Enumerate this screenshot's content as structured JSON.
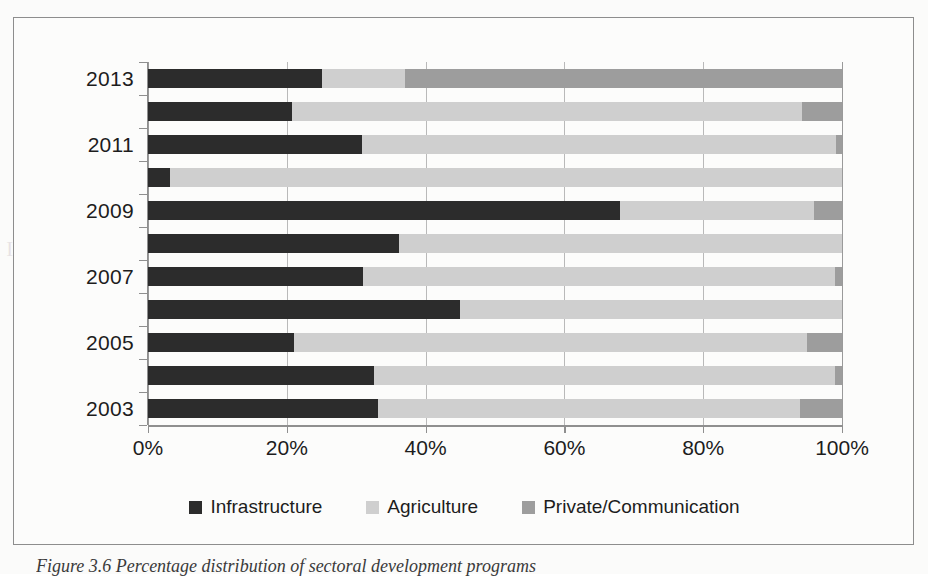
{
  "figure": {
    "caption": "Figure 3.6 Percentage distribution of sectoral development programs"
  },
  "chart_data": {
    "type": "bar",
    "orientation": "horizontal",
    "stacked": true,
    "normalized": true,
    "title": "",
    "xlabel": "",
    "ylabel": "",
    "xlim": [
      0,
      100
    ],
    "xticks": [
      "0%",
      "20%",
      "40%",
      "60%",
      "80%",
      "100%"
    ],
    "xtick_values": [
      0,
      20,
      40,
      60,
      80,
      100
    ],
    "grid": true,
    "grid_axis": "x",
    "legend_position": "bottom",
    "categories": [
      "2013",
      "2012",
      "2011",
      "2010",
      "2009",
      "2008",
      "2007",
      "2006",
      "2005",
      "2004",
      "2003"
    ],
    "visible_category_labels": [
      "2013",
      "2011",
      "2009",
      "2007",
      "2005",
      "2003"
    ],
    "series": [
      {
        "name": "Infrastructure",
        "color": "#2c2c2c",
        "values": [
          25.0,
          20.8,
          30.8,
          3.2,
          68.0,
          36.2,
          31.0,
          45.0,
          21.0,
          32.5,
          33.2
        ]
      },
      {
        "name": "Agriculture",
        "color": "#cfcfcf",
        "values": [
          12.0,
          73.4,
          68.4,
          96.8,
          28.0,
          63.8,
          68.0,
          55.0,
          74.0,
          66.5,
          60.8
        ]
      },
      {
        "name": "Private/Communication",
        "color": "#9d9d9d",
        "values": [
          63.0,
          5.8,
          0.8,
          0.0,
          4.0,
          0.0,
          1.0,
          0.0,
          5.0,
          1.0,
          6.0
        ]
      }
    ]
  },
  "legend": {
    "items": [
      {
        "label": "Infrastructure",
        "color": "#2c2c2c",
        "swatch_name": "legend-swatch-infrastructure"
      },
      {
        "label": "Agriculture",
        "color": "#cfcfcf",
        "swatch_name": "legend-swatch-agriculture"
      },
      {
        "label": "Private/Communication",
        "color": "#9d9d9d",
        "swatch_name": "legend-swatch-private-communication"
      }
    ]
  }
}
